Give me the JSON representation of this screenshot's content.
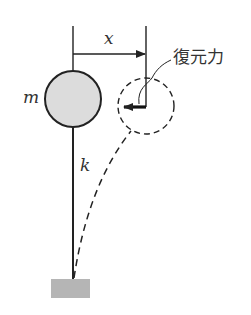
{
  "diagram": {
    "type": "mechanics-schematic",
    "labels": {
      "displacement": "x",
      "mass": "m",
      "stiffness": "k",
      "restoring_force": "復元力"
    },
    "colors": {
      "stroke": "#222222",
      "mass_fill": "#dcdcdc",
      "base_fill": "#b5b5b5",
      "text": "#333333"
    },
    "elements": [
      {
        "id": "mass",
        "shape": "circle",
        "label": "m"
      },
      {
        "id": "rod",
        "shape": "line",
        "label": "k"
      },
      {
        "id": "base",
        "shape": "rect"
      },
      {
        "id": "displacement-arrow",
        "shape": "arrow",
        "label": "x"
      },
      {
        "id": "displaced-mass",
        "shape": "dashed-circle"
      },
      {
        "id": "deflected-rod",
        "shape": "dashed-curve"
      },
      {
        "id": "restoring-force-arrow",
        "shape": "arrow",
        "label": "復元力"
      }
    ]
  }
}
